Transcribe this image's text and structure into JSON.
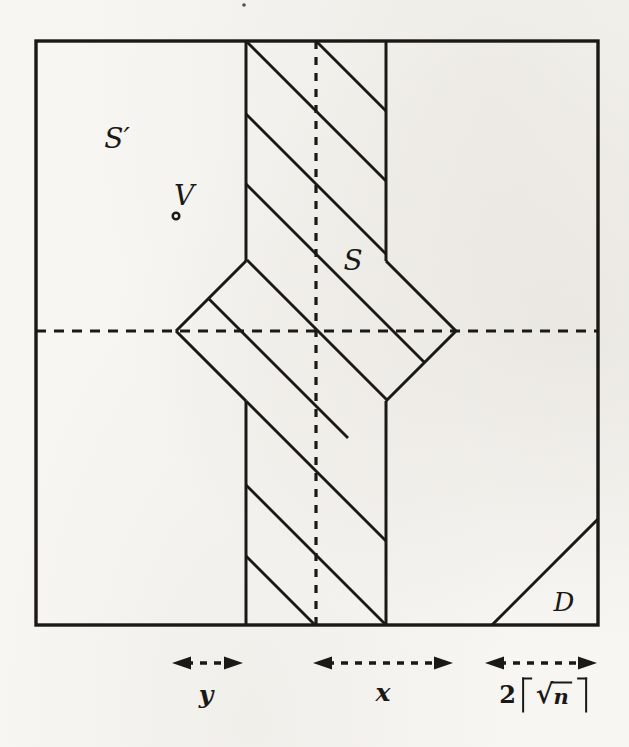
{
  "figure": {
    "type": "math-diagram",
    "background_color": "#f8f6f2",
    "ink_color": "#1b1915",
    "labels": {
      "s_prime": "S′",
      "v": "V",
      "s": "S",
      "d": "D",
      "dim_y": "y",
      "dim_x": "x",
      "dim_sqrt": "2⌈√n⌉",
      "dim_sqrt_parts": {
        "coefficient": "2",
        "radical": "√",
        "radicand": "n"
      }
    },
    "geometry": {
      "canvas": {
        "width": 629,
        "height": 747
      },
      "square": {
        "x1": 36,
        "y1": 41,
        "x2": 598,
        "y2": 625
      },
      "solid_segments": [
        {
          "name": "strip-left-edge-upper",
          "x1": 246,
          "y1": 41,
          "x2": 246,
          "y2": 261
        },
        {
          "name": "strip-left-edge-lower",
          "x1": 246,
          "y1": 401,
          "x2": 246,
          "y2": 625
        },
        {
          "name": "strip-right-edge-upper",
          "x1": 386,
          "y1": 41,
          "x2": 386,
          "y2": 261
        },
        {
          "name": "strip-right-edge-lower",
          "x1": 386,
          "y1": 401,
          "x2": 386,
          "y2": 625
        },
        {
          "name": "diamond-upper-left-edge",
          "x1": 246,
          "y1": 261,
          "x2": 176,
          "y2": 331
        },
        {
          "name": "diamond-lower-left-edge",
          "x1": 176,
          "y1": 331,
          "x2": 246,
          "y2": 401
        },
        {
          "name": "diamond-upper-right-edge",
          "x1": 386,
          "y1": 261,
          "x2": 456,
          "y2": 331
        },
        {
          "name": "diamond-lower-right-edge",
          "x1": 456,
          "y1": 331,
          "x2": 386,
          "y2": 401
        },
        {
          "name": "corner-d-diagonal",
          "x1": 492,
          "y1": 625,
          "x2": 598,
          "y2": 519
        }
      ],
      "hatch_segments": [
        [
          316,
          41,
          386,
          111
        ],
        [
          246,
          41,
          386,
          181
        ],
        [
          246,
          114,
          386,
          254
        ],
        [
          246,
          184,
          424,
          362
        ],
        [
          247,
          260,
          387,
          400
        ],
        [
          208,
          298,
          348,
          438
        ],
        [
          246,
          401,
          386,
          541
        ],
        [
          246,
          485,
          386,
          625
        ],
        [
          246,
          556,
          315,
          625
        ]
      ],
      "dashed_lines": [
        {
          "name": "dashed-horizontal-axis",
          "x1": 36,
          "y1": 331,
          "x2": 598,
          "y2": 331,
          "dash": "10 8"
        },
        {
          "name": "dashed-vertical-axis",
          "x1": 316,
          "y1": 41,
          "x2": 316,
          "y2": 625,
          "dash": "8 8"
        }
      ],
      "point_marker": {
        "cx": 176,
        "cy": 216,
        "r": 3.3
      },
      "stray_dot": {
        "cx": 244,
        "cy": 5,
        "r": 1.8
      },
      "dimension_arrows": [
        {
          "name": "dim-arrow-y",
          "x1": 172,
          "x2": 243,
          "y": 663
        },
        {
          "name": "dim-arrow-x",
          "x1": 313,
          "x2": 453,
          "y": 663
        },
        {
          "name": "dim-arrow-sqrt",
          "x1": 485,
          "x2": 597,
          "y": 663
        }
      ]
    }
  }
}
